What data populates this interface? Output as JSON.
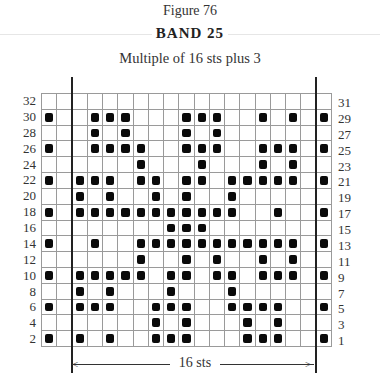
{
  "header": {
    "figure_label": "Figure 76",
    "title": "BAND 25",
    "subtitle": "Multiple of 16 sts plus 3"
  },
  "repeat_label": "16 sts",
  "colors": {
    "filled": "#0a0a0a",
    "grid_line": "#9a9a9a",
    "background": "#ffffff"
  },
  "chart_data": {
    "type": "heatmap",
    "title": "BAND 25",
    "subtitle": "Multiple of 16 sts plus 3",
    "columns": 19,
    "rows": 16,
    "repeat": {
      "label": "16 sts",
      "start_col": 2,
      "end_col": 17
    },
    "left_row_labels": [
      "32",
      "30",
      "28",
      "26",
      "24",
      "22",
      "20",
      "18",
      "16",
      "14",
      "12",
      "10",
      "8",
      "6",
      "4",
      "2"
    ],
    "right_row_labels": [
      "31",
      "29",
      "27",
      "25",
      "23",
      "21",
      "19",
      "17",
      "15",
      "13",
      "11",
      "9",
      "7",
      "5",
      "3",
      "1"
    ],
    "legend": "Filled square = contrast color stitch; empty = background color",
    "filled_cells_by_row": [
      {
        "row": "32/31",
        "cols": []
      },
      {
        "row": "30/29",
        "cols": [
          0,
          3,
          4,
          5,
          9,
          10,
          11,
          14,
          16,
          18
        ]
      },
      {
        "row": "28/27",
        "cols": [
          3,
          5,
          9,
          11
        ]
      },
      {
        "row": "26/25",
        "cols": [
          0,
          3,
          4,
          5,
          6,
          9,
          10,
          11,
          14,
          15,
          16,
          18
        ]
      },
      {
        "row": "24/23",
        "cols": [
          6,
          10,
          14,
          16
        ]
      },
      {
        "row": "22/21",
        "cols": [
          0,
          2,
          3,
          4,
          6,
          7,
          9,
          10,
          12,
          13,
          14,
          15,
          16,
          18
        ]
      },
      {
        "row": "20/19",
        "cols": [
          2,
          4,
          7,
          9,
          12
        ]
      },
      {
        "row": "18/17",
        "cols": [
          0,
          2,
          3,
          4,
          5,
          6,
          7,
          8,
          9,
          10,
          11,
          12,
          15,
          18
        ]
      },
      {
        "row": "16/15",
        "cols": [
          8,
          9,
          10
        ]
      },
      {
        "row": "14/13",
        "cols": [
          0,
          3,
          6,
          7,
          8,
          9,
          10,
          11,
          12,
          13,
          14,
          15,
          16,
          18
        ]
      },
      {
        "row": "12/11",
        "cols": [
          6,
          9,
          11,
          14,
          16
        ]
      },
      {
        "row": "10/9",
        "cols": [
          0,
          2,
          3,
          4,
          5,
          6,
          8,
          9,
          11,
          12,
          14,
          15,
          16,
          18
        ]
      },
      {
        "row": "8/7",
        "cols": [
          2,
          4,
          8,
          12
        ]
      },
      {
        "row": "6/5",
        "cols": [
          0,
          2,
          3,
          4,
          7,
          8,
          9,
          12,
          13,
          14,
          15,
          18
        ]
      },
      {
        "row": "4/3",
        "cols": [
          7,
          9,
          13,
          15
        ]
      },
      {
        "row": "2/1",
        "cols": [
          0,
          2,
          4,
          7,
          8,
          9,
          13,
          14,
          15,
          18
        ]
      }
    ]
  }
}
